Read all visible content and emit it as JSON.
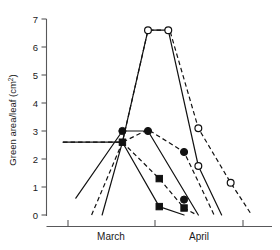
{
  "figure": {
    "background_color": "#ffffff",
    "ink_color": "#111111",
    "axis_color": "#58585a"
  },
  "chart_data": {
    "type": "line",
    "title": "",
    "xlabel": "",
    "ylabel": "Green area/leaf (cm2)",
    "ylabel_text": "Green area/leaf (cm",
    "ylabel_sup": "2",
    "ylabel_tail": ")",
    "ylim": [
      0,
      7
    ],
    "yticks": [
      0,
      1,
      2,
      3,
      4,
      5,
      6,
      7
    ],
    "ytick_labels": [
      "0",
      "1",
      "2",
      "3",
      "4",
      "5",
      "6",
      "7"
    ],
    "xlim": [
      0,
      3
    ],
    "xticks": [
      0,
      1,
      2,
      3
    ],
    "xtick_labels": [
      "",
      "",
      "",
      ""
    ],
    "x_category_labels": [
      "March",
      "April"
    ],
    "grid": false,
    "legend_position": "none",
    "series": [
      {
        "name": "open-circle-solid",
        "marker": "open-circle",
        "linestyle": "solid",
        "x": [
          0.74,
          1.01,
          1.35,
          1.62,
          2.02,
          2.33
        ],
        "y": [
          0.0,
          2.6,
          6.6,
          6.6,
          1.75,
          0.0
        ]
      },
      {
        "name": "open-circle-dashed",
        "marker": "open-circle",
        "linestyle": "dashed",
        "x": [
          0.6,
          1.01,
          1.35,
          1.64,
          2.02,
          2.45,
          2.73
        ],
        "y": [
          0.0,
          2.6,
          6.6,
          6.6,
          3.1,
          1.15,
          0.0
        ]
      },
      {
        "name": "filled-circle-solid",
        "marker": "filled-circle",
        "linestyle": "solid",
        "x": [
          0.39,
          1.01,
          1.35,
          2.02
        ],
        "y": [
          0.6,
          3.0,
          3.0,
          0.0
        ]
      },
      {
        "name": "filled-circle-dashed",
        "marker": "filled-circle",
        "linestyle": "dashed",
        "x": [
          0.22,
          1.01,
          1.35,
          1.83,
          2.23
        ],
        "y": [
          2.6,
          2.6,
          3.05,
          2.25,
          0.0
        ]
      },
      {
        "name": "filled-square-solid",
        "marker": "filled-square",
        "linestyle": "solid",
        "x": [
          0.22,
          1.01,
          1.5,
          1.83
        ],
        "y": [
          2.6,
          2.6,
          0.3,
          0.0
        ]
      },
      {
        "name": "filled-square-dashed",
        "marker": "filled-square",
        "linestyle": "dashed",
        "x": [
          1.01,
          1.5,
          1.83,
          2.0
        ],
        "y": [
          2.6,
          1.3,
          0.25,
          0.0
        ]
      }
    ],
    "marker_points": [
      {
        "series": "open-circle-solid",
        "x": 1.35,
        "y": 6.6
      },
      {
        "series": "open-circle-solid",
        "x": 1.62,
        "y": 6.6
      },
      {
        "series": "open-circle-solid",
        "x": 2.02,
        "y": 1.75
      },
      {
        "series": "open-circle-dashed",
        "x": 2.02,
        "y": 3.1
      },
      {
        "series": "open-circle-dashed",
        "x": 2.45,
        "y": 1.15
      },
      {
        "series": "filled-circle",
        "x": 1.01,
        "y": 3.0
      },
      {
        "series": "filled-circle",
        "x": 1.35,
        "y": 3.0
      },
      {
        "series": "filled-circle",
        "x": 1.83,
        "y": 2.25
      },
      {
        "series": "filled-circle",
        "x": 1.83,
        "y": 0.55
      },
      {
        "series": "filled-square",
        "x": 1.01,
        "y": 2.6
      },
      {
        "series": "filled-square",
        "x": 1.5,
        "y": 1.3
      },
      {
        "series": "filled-square",
        "x": 1.5,
        "y": 0.3
      },
      {
        "series": "filled-square",
        "x": 1.83,
        "y": 0.25
      }
    ]
  }
}
